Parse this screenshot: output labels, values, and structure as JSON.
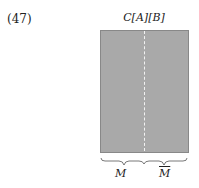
{
  "equation_number": "(47)",
  "diagram": {
    "title": "C[A][B]",
    "block_color": "#a9a9a9",
    "divider": "dashed",
    "braces": [
      {
        "label": "M"
      },
      {
        "label": "M",
        "overline": true
      }
    ]
  }
}
